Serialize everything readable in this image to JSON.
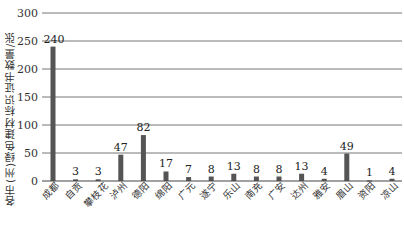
{
  "chart_data": {
    "type": "bar",
    "title": "",
    "xlabel": "",
    "ylabel": "各市(州)绿色建材标识证书数量/张",
    "ylim": [
      0,
      300
    ],
    "yticks": [
      0,
      50,
      100,
      150,
      200,
      250,
      300
    ],
    "grid": true,
    "legend": null,
    "bar_color": "#555555",
    "categories": [
      "成都",
      "自贡",
      "攀枝花",
      "泸州",
      "德阳",
      "绵阳",
      "广元",
      "遂宁",
      "乐山",
      "南充",
      "广安",
      "达州",
      "雅安",
      "眉山",
      "资阳",
      "凉山"
    ],
    "values": [
      240,
      3,
      3,
      47,
      82,
      17,
      7,
      8,
      13,
      8,
      8,
      13,
      4,
      49,
      1,
      4
    ],
    "data_labels": [
      "240",
      "3",
      "3",
      "47",
      "82",
      "17",
      "7",
      "8",
      "13",
      "8",
      "8",
      "13",
      "4",
      "49",
      "1",
      "4"
    ]
  }
}
